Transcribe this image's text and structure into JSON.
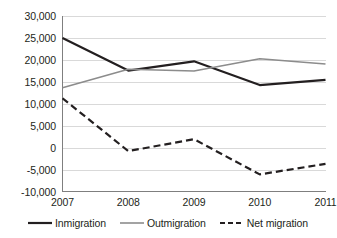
{
  "chart_data": {
    "type": "line",
    "title": "",
    "subtitle": "",
    "xlabel": "",
    "ylabel": "",
    "categories": [
      "2007",
      "2008",
      "2009",
      "2010",
      "2011"
    ],
    "x": [
      2007,
      2008,
      2009,
      2010,
      2011
    ],
    "ylim": [
      -10000,
      30000
    ],
    "xlim": [
      2007,
      2011
    ],
    "ytick_labels": [
      "30,000",
      "25,000",
      "20,000",
      "15,000",
      "10,000",
      "5,000",
      "0",
      "-5,000",
      "-10,000"
    ],
    "ytick_values": [
      30000,
      25000,
      20000,
      15000,
      10000,
      5000,
      0,
      -5000,
      -10000
    ],
    "xtick_labels": [
      "2007",
      "2008",
      "2009",
      "2010",
      "2011"
    ],
    "grid": "horizontal",
    "legend_position": "bottom",
    "series": [
      {
        "name": "Inmigration",
        "values": [
          25000,
          17600,
          19700,
          14300,
          15500
        ],
        "color": "#231f20",
        "style": "solid",
        "width": 2.2
      },
      {
        "name": "Outmigration",
        "values": [
          13700,
          17900,
          17500,
          20300,
          19100
        ],
        "color": "#8c8c8c",
        "style": "solid",
        "width": 1.6
      },
      {
        "name": "Net migration",
        "values": [
          11300,
          -700,
          2000,
          -6000,
          -3600
        ],
        "color": "#231f20",
        "style": "dashed",
        "width": 2.2
      }
    ]
  },
  "legend": {
    "items": [
      {
        "label": "Inmigration",
        "color": "#231f20",
        "style": "solid"
      },
      {
        "label": "Outmigration",
        "color": "#8c8c8c",
        "style": "solid"
      },
      {
        "label": "Net migration",
        "color": "#231f20",
        "style": "dashed"
      }
    ]
  },
  "axes": {
    "axis_color": "#7f7f7f",
    "grid_color": "#d9d9d9",
    "text_color": "#231f20"
  }
}
